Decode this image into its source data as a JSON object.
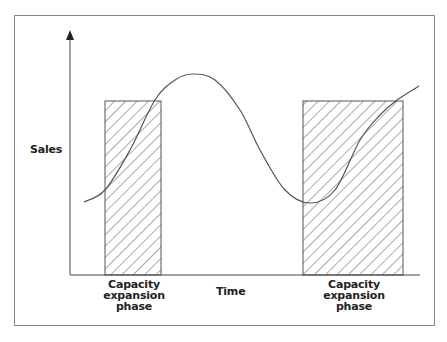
{
  "chart_data": {
    "type": "line",
    "title": "",
    "xlabel": "Time",
    "ylabel": "Sales",
    "grid": false,
    "legend": null,
    "axes": {
      "x_ticks": [],
      "y_ticks": [],
      "x_arrow": false,
      "y_arrow": true
    },
    "series": [
      {
        "name": "Sales",
        "description": "Cyclical sales curve over time: rises to a peak, falls to a trough, then rises again",
        "points_px": [
          [
            84,
            202
          ],
          [
            105,
            190
          ],
          [
            130,
            150
          ],
          [
            155,
            100
          ],
          [
            175,
            80
          ],
          [
            193,
            74
          ],
          [
            215,
            80
          ],
          [
            240,
            110
          ],
          [
            260,
            150
          ],
          [
            285,
            190
          ],
          [
            310,
            203
          ],
          [
            335,
            190
          ],
          [
            360,
            140
          ],
          [
            380,
            115
          ],
          [
            397,
            100
          ],
          [
            419,
            86
          ]
        ]
      }
    ],
    "shaded_regions": [
      {
        "label": "Capacity expansion phase",
        "x_px": [
          105,
          161
        ],
        "y_px": [
          101,
          275
        ],
        "pattern": "diagonal-hatch"
      },
      {
        "label": "Capacity expansion phase",
        "x_px": [
          303,
          403
        ],
        "y_px": [
          101,
          275
        ],
        "pattern": "diagonal-hatch"
      }
    ],
    "annotations": [
      "Capacity expansion phase",
      "Capacity expansion phase"
    ]
  },
  "labels": {
    "y_axis": "Sales",
    "x_axis": "Time",
    "phase_left": [
      "Capacity",
      "expansion",
      "phase"
    ],
    "phase_right": [
      "Capacity",
      "expansion",
      "phase"
    ]
  },
  "colors": {
    "frame": "#8a8a8a",
    "axis": "#444444",
    "curve": "#555555",
    "hatch": "#555555",
    "text": "#222222"
  }
}
